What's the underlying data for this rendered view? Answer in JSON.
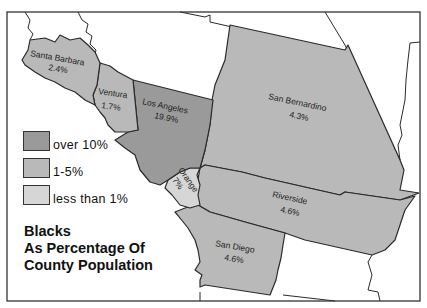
{
  "map": {
    "title_lines": [
      "Blacks",
      "As Percentage Of",
      "County Population"
    ],
    "colors": {
      "over_10": "#9a9a9a",
      "between_1_5": "#b9b9b9",
      "under_1": "#d6d6d6",
      "background": "#ffffff",
      "border": "#2a2a2a"
    },
    "legend": [
      {
        "label": "over 10%",
        "color": "#9a9a9a"
      },
      {
        "label": "1-5%",
        "color": "#b9b9b9"
      },
      {
        "label": "less than 1%",
        "color": "#d6d6d6"
      }
    ],
    "counties": [
      {
        "name": "Santa Barbara",
        "value": "2.4%"
      },
      {
        "name": "Ventura",
        "value": "1.7%"
      },
      {
        "name": "Los Angeles",
        "value": "19.9%"
      },
      {
        "name": "San Bernardino",
        "value": "4.3%"
      },
      {
        "name": "Orange",
        "value": "7%"
      },
      {
        "name": "Riverside",
        "value": "4.6%"
      },
      {
        "name": "San Diego",
        "value": "4.6%"
      }
    ]
  }
}
